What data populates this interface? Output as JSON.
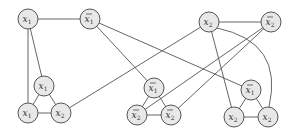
{
  "diagram": {
    "type": "graph",
    "node_radius": 10,
    "colors": {
      "node_fill": "#e8e8e8",
      "node_stroke": "#555555",
      "edge": "#555555",
      "text": "#333333"
    },
    "nodes": [
      {
        "id": "v_x1",
        "var": "x",
        "sub": "1",
        "negated": false,
        "x": 28,
        "y": 19
      },
      {
        "id": "v_nx1",
        "var": "x",
        "sub": "1",
        "negated": true,
        "x": 90,
        "y": 19
      },
      {
        "id": "v_x2",
        "var": "x",
        "sub": "2",
        "negated": false,
        "x": 209,
        "y": 22
      },
      {
        "id": "v_nx2",
        "var": "x",
        "sub": "2",
        "negated": true,
        "x": 271,
        "y": 22
      },
      {
        "id": "c1_a",
        "var": "x",
        "sub": "1",
        "negated": false,
        "x": 44,
        "y": 86
      },
      {
        "id": "c1_b",
        "var": "x",
        "sub": "1",
        "negated": false,
        "x": 28,
        "y": 113
      },
      {
        "id": "c1_c",
        "var": "x",
        "sub": "2",
        "negated": false,
        "x": 61,
        "y": 113
      },
      {
        "id": "c2_a",
        "var": "x",
        "sub": "1",
        "negated": true,
        "x": 154,
        "y": 88
      },
      {
        "id": "c2_b",
        "var": "x",
        "sub": "2",
        "negated": true,
        "x": 137,
        "y": 115
      },
      {
        "id": "c2_c",
        "var": "x",
        "sub": "2",
        "negated": true,
        "x": 171,
        "y": 115
      },
      {
        "id": "c3_a",
        "var": "x",
        "sub": "1",
        "negated": true,
        "x": 251,
        "y": 90
      },
      {
        "id": "c3_b",
        "var": "x",
        "sub": "2",
        "negated": false,
        "x": 234,
        "y": 117
      },
      {
        "id": "c3_c",
        "var": "x",
        "sub": "2",
        "negated": false,
        "x": 268,
        "y": 117
      }
    ],
    "edges": [
      {
        "from": "v_x1",
        "to": "v_nx1"
      },
      {
        "from": "v_x2",
        "to": "v_nx2"
      },
      {
        "from": "c1_a",
        "to": "c1_b"
      },
      {
        "from": "c1_b",
        "to": "c1_c"
      },
      {
        "from": "c1_a",
        "to": "c1_c"
      },
      {
        "from": "c2_a",
        "to": "c2_b"
      },
      {
        "from": "c2_b",
        "to": "c2_c"
      },
      {
        "from": "c2_a",
        "to": "c2_c"
      },
      {
        "from": "c3_a",
        "to": "c3_b"
      },
      {
        "from": "c3_b",
        "to": "c3_c"
      },
      {
        "from": "c3_a",
        "to": "c3_c"
      },
      {
        "from": "v_x1",
        "to": "c1_a"
      },
      {
        "from": "v_x1",
        "to": "c1_b"
      },
      {
        "from": "v_x2",
        "to": "c1_c"
      },
      {
        "from": "v_nx1",
        "to": "c2_a"
      },
      {
        "from": "v_nx2",
        "to": "c2_b"
      },
      {
        "from": "v_nx2",
        "to": "c2_c"
      },
      {
        "from": "v_nx1",
        "to": "c3_a"
      },
      {
        "from": "v_x2",
        "to": "c3_b"
      },
      {
        "from": "v_x2",
        "to": "c3_c",
        "curved": true
      }
    ]
  }
}
